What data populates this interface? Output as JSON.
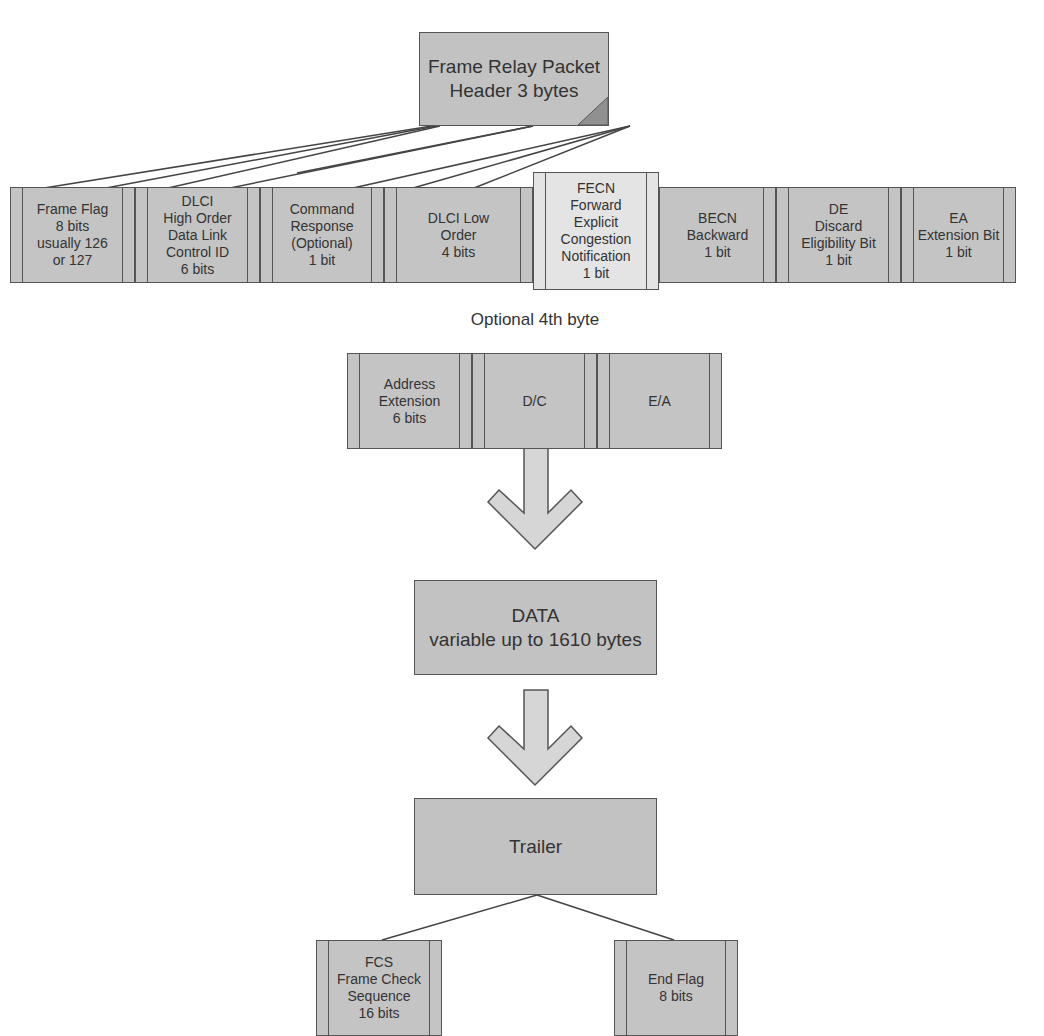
{
  "header": {
    "title_line1": "Frame Relay Packet",
    "title_line2": "Header 3 bytes"
  },
  "header_fields": [
    {
      "label": "Frame Flag\n8 bits\nusually 126\nor 127"
    },
    {
      "label": "DLCI\nHigh Order\nData Link\nControl ID\n6 bits"
    },
    {
      "label": "Command\nResponse\n(Optional)\n1 bit"
    },
    {
      "label": "DLCI Low\nOrder\n4 bits"
    },
    {
      "label": "FECN\nForward\nExplicit\nCongestion\nNotification\n1 bit"
    },
    {
      "label": "BECN\nBackward\n1 bit"
    },
    {
      "label": "DE\nDiscard\nEligibility Bit\n1 bit"
    },
    {
      "label": "EA\nExtension Bit\n1 bit"
    }
  ],
  "optional_byte": {
    "caption": "Optional 4th byte",
    "fields": [
      {
        "label": "Address\nExtension\n6 bits"
      },
      {
        "label": "D/C"
      },
      {
        "label": "E/A"
      }
    ]
  },
  "data_box": {
    "line1": "DATA",
    "line2": "variable up to 1610 bytes"
  },
  "trailer": {
    "label": "Trailer",
    "fields": [
      {
        "label": "FCS\nFrame Check\nSequence\n16 bits"
      },
      {
        "label": "End Flag\n8 bits"
      }
    ]
  },
  "colors": {
    "box_fill": "#c2c2c2",
    "highlight_fill": "#e4e4e4",
    "arrow_fill": "#d6d6d6",
    "stroke": "#555555"
  }
}
